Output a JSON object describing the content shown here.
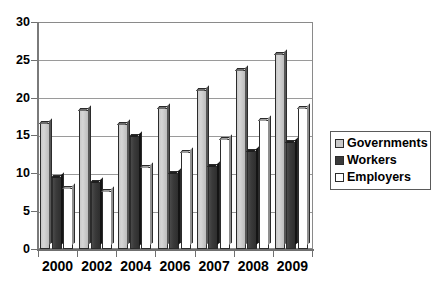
{
  "chart_data": {
    "type": "bar",
    "title": "",
    "subtitle": "",
    "xlabel": "",
    "ylabel": "",
    "categories": [
      "2000",
      "2002",
      "2004",
      "2006",
      "2007",
      "2008",
      "2009"
    ],
    "series": [
      {
        "name": "Governments",
        "color": "#c9c9c9",
        "values": [
          16.7,
          18.4,
          16.5,
          18.7,
          21.0,
          23.6,
          25.8
        ]
      },
      {
        "name": "Workers",
        "color": "#3a3a3a",
        "values": [
          9.5,
          8.9,
          15.0,
          10.0,
          11.0,
          13.0,
          14.2
        ]
      },
      {
        "name": "Employers",
        "color": "#ffffff",
        "values": [
          8.0,
          7.7,
          10.8,
          12.8,
          14.6,
          17.0,
          18.7
        ]
      }
    ],
    "ylim": [
      0,
      30
    ],
    "yticks": [
      0,
      5,
      10,
      15,
      20,
      25,
      30
    ],
    "ytick_labels": [
      "0",
      "5",
      "10",
      "15",
      "20",
      "25",
      "30"
    ],
    "grid": true,
    "grid_axis": "y",
    "legend": {
      "position": "right",
      "entries": [
        "Governments",
        "Workers",
        "Employers"
      ]
    }
  },
  "legend": {
    "items": [
      {
        "label": "Governments"
      },
      {
        "label": "Workers"
      },
      {
        "label": "Employers"
      }
    ]
  }
}
